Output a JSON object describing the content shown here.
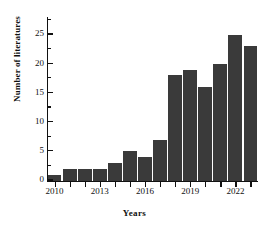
{
  "chart_data": {
    "type": "bar",
    "title": "",
    "subtitle": "",
    "xlabel": "Years",
    "ylabel": "Number of literatures",
    "categories": [
      "2010",
      "2011",
      "2012",
      "2013",
      "2014",
      "2015",
      "2016",
      "2017",
      "2018",
      "2019",
      "2020",
      "2021",
      "2022",
      "2023"
    ],
    "values": [
      1,
      2,
      2,
      2,
      3,
      5,
      4,
      7,
      18,
      19,
      16,
      20,
      25,
      23
    ],
    "x_tick_labels": [
      "2010",
      "2013",
      "2016",
      "2019",
      "2022"
    ],
    "x_tick_categories": [
      "2010",
      "2013",
      "2016",
      "2019",
      "2022"
    ],
    "y_tick_labels": [
      "0",
      "5",
      "10",
      "15",
      "20",
      "25"
    ],
    "y_ticks": [
      0,
      5,
      10,
      15,
      20,
      25
    ],
    "y_minor_ticks": [
      2.5,
      7.5,
      12.5,
      17.5,
      22.5,
      27.5
    ],
    "ylim": [
      0,
      28
    ],
    "grid": false,
    "legend": false,
    "legend_position": "none",
    "bar_color": "#3a3a3a",
    "axis_color": "#111111",
    "background_color": "#ffffff"
  }
}
